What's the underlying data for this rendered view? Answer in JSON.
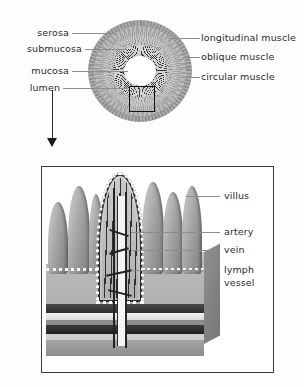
{
  "figure": {
    "cross_section": {
      "left_labels": [
        {
          "text": "serosa",
          "y": 33
        },
        {
          "text": "submucosa",
          "y": 49
        },
        {
          "text": "mucosa",
          "y": 71
        },
        {
          "text": "lumen",
          "y": 88
        }
      ],
      "right_labels": [
        {
          "text": "longitudinal muscle",
          "y": 38
        },
        {
          "text": "oblique muscle",
          "y": 57
        },
        {
          "text": "circular muscle",
          "y": 77
        }
      ],
      "callout": "magnified-region"
    },
    "detail_panel": {
      "labels": [
        {
          "text": "villus",
          "y": 196
        },
        {
          "text": "artery",
          "y": 232
        },
        {
          "text": "vein",
          "y": 250
        },
        {
          "text": "lymph",
          "y": 270
        },
        {
          "text": "vessel",
          "y": 283
        }
      ]
    },
    "colors": {
      "ink": "#2b2b2b",
      "leader": "#8d8d8d",
      "panel_border": "#3b3b3b",
      "tissue_light": "#cfcfcf",
      "tissue_mid": "#a6a6a6",
      "tissue_dark": "#2e2e2e"
    }
  }
}
